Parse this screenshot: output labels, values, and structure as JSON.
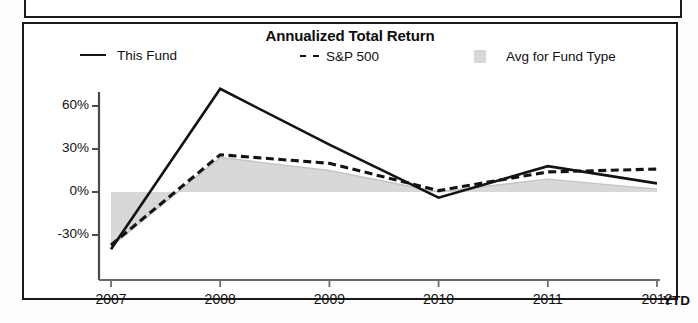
{
  "chart_data": {
    "type": "line",
    "title": "Annualized Total Return",
    "xlabel": "",
    "ylabel": "",
    "x": [
      "2007",
      "2008",
      "2009",
      "2010",
      "2011",
      "2012"
    ],
    "categories": [
      "2007",
      "2008",
      "2009",
      "2010",
      "2011",
      "2012"
    ],
    "xtick_labels": [
      "2007",
      "2008",
      "2009",
      "2010",
      "2011",
      "2012"
    ],
    "xtick_suffix": "YTD",
    "ytick_labels": [
      "60%",
      "30%",
      "0%",
      "-30%"
    ],
    "ytick_values": [
      60,
      30,
      0,
      -30
    ],
    "ylim": [
      -45,
      80
    ],
    "grid": false,
    "legend_position": "top",
    "series": [
      {
        "name": "This Fund",
        "style": "solid",
        "color": "#131313",
        "values": [
          -40,
          72,
          33,
          -4,
          18,
          6
        ]
      },
      {
        "name": "S&P 500",
        "style": "dashed",
        "color": "#131313",
        "values": [
          -37,
          26,
          20,
          1,
          14,
          16
        ]
      },
      {
        "name": "Avg for Fund Type",
        "style": "area",
        "color": "#d8d8d8",
        "values": [
          -38,
          24,
          15,
          0,
          9,
          2
        ]
      }
    ]
  },
  "chart": {
    "title": "Annualized Total Return",
    "legend": [
      {
        "label": "This Fund",
        "icon": "solid-line-swatch"
      },
      {
        "label": "S&P 500",
        "icon": "dashed-line-swatch"
      },
      {
        "label": "Avg for Fund Type",
        "icon": "gray-area-swatch"
      }
    ],
    "y_axis": {
      "ticks": [
        "60%",
        "30%",
        "0%",
        "-30%"
      ]
    },
    "x_axis": {
      "ticks": [
        "2007",
        "2008",
        "2009",
        "2010",
        "2011",
        "2012"
      ],
      "trailing_label": "YTD"
    }
  }
}
